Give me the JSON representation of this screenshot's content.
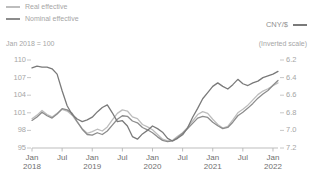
{
  "legend": {
    "items": [
      {
        "label": "Real effective",
        "color": "#bdbdbd",
        "name": "legend-real-effective"
      },
      {
        "label": "Nominal effective",
        "color": "#8c8c8c",
        "name": "legend-nominal-effective"
      }
    ],
    "right": {
      "label": "CNY/$",
      "color": "#7a7a7a"
    }
  },
  "notes": {
    "left": "Jan 2018 = 100",
    "right": "(Inverted scale)"
  },
  "chart_data": {
    "type": "line",
    "title": "",
    "subtitle": "",
    "xlabel": "",
    "ylabel": "Jan 2018 = 100",
    "y2label": "CNY/$",
    "grid": false,
    "legend_position": "top-left",
    "ylim": [
      95,
      110
    ],
    "yticks": [
      "110",
      "107",
      "104",
      "101",
      "98",
      "95"
    ],
    "y2lim": [
      7.2,
      6.2
    ],
    "y2ticks": [
      "6.2",
      "6.4",
      "6.6",
      "6.8",
      "7.0",
      "7.2"
    ],
    "y2_inverted": true,
    "xticks": [
      {
        "label": "Jan",
        "sub": "2018"
      },
      {
        "label": "Jul",
        "sub": ""
      },
      {
        "label": "Jan",
        "sub": "2019"
      },
      {
        "label": "Jul",
        "sub": ""
      },
      {
        "label": "Jan",
        "sub": "2020"
      },
      {
        "label": "Jul",
        "sub": ""
      },
      {
        "label": "Jan",
        "sub": "2021"
      },
      {
        "label": "Jul",
        "sub": ""
      },
      {
        "label": "Jan",
        "sub": "2022"
      }
    ],
    "x": [
      "2018-01",
      "2018-02",
      "2018-03",
      "2018-04",
      "2018-05",
      "2018-06",
      "2018-07",
      "2018-08",
      "2018-09",
      "2018-10",
      "2018-11",
      "2018-12",
      "2019-01",
      "2019-02",
      "2019-03",
      "2019-04",
      "2019-05",
      "2019-06",
      "2019-07",
      "2019-08",
      "2019-09",
      "2019-10",
      "2019-11",
      "2019-12",
      "2020-01",
      "2020-02",
      "2020-03",
      "2020-04",
      "2020-05",
      "2020-06",
      "2020-07",
      "2020-08",
      "2020-09",
      "2020-10",
      "2020-11",
      "2020-12",
      "2021-01",
      "2021-02",
      "2021-03",
      "2021-04",
      "2021-05",
      "2021-06",
      "2021-07",
      "2021-08",
      "2021-09",
      "2021-10",
      "2021-11",
      "2021-12",
      "2022-01",
      "2022-02"
    ],
    "series": [
      {
        "name": "Real effective",
        "axis": "left",
        "color": "#bdbdbd",
        "values": [
          100.0,
          100.6,
          101.4,
          100.7,
          100.3,
          100.9,
          101.6,
          101.3,
          100.6,
          99.4,
          98.3,
          97.5,
          97.8,
          98.2,
          97.9,
          98.6,
          99.8,
          100.9,
          101.5,
          101.3,
          100.3,
          100.0,
          99.0,
          98.6,
          98.1,
          97.3,
          96.5,
          96.2,
          96.3,
          97.0,
          97.6,
          98.5,
          99.6,
          100.7,
          101.2,
          100.9,
          99.9,
          99.0,
          98.4,
          98.7,
          99.8,
          101.0,
          101.6,
          102.3,
          103.2,
          104.1,
          104.7,
          105.1,
          105.6,
          106.1
        ]
      },
      {
        "name": "Nominal effective",
        "axis": "left",
        "color": "#8c8c8c",
        "values": [
          99.7,
          100.3,
          101.1,
          100.5,
          100.1,
          100.8,
          101.7,
          101.5,
          100.9,
          99.5,
          98.2,
          97.3,
          97.2,
          97.6,
          97.3,
          97.9,
          98.9,
          99.9,
          100.5,
          100.4,
          99.6,
          99.3,
          98.5,
          98.1,
          97.6,
          96.9,
          96.3,
          96.1,
          96.2,
          96.8,
          97.5,
          98.3,
          99.2,
          100.1,
          100.4,
          100.2,
          99.4,
          98.8,
          98.3,
          98.5,
          99.4,
          100.5,
          101.1,
          101.8,
          102.6,
          103.5,
          104.2,
          104.8,
          105.7,
          106.5
        ]
      },
      {
        "name": "CNY/$",
        "axis": "right",
        "color": "#7a7a7a",
        "values": [
          6.29,
          6.27,
          6.28,
          6.28,
          6.3,
          6.36,
          6.55,
          6.72,
          6.82,
          6.87,
          6.9,
          6.88,
          6.85,
          6.79,
          6.74,
          6.71,
          6.8,
          6.9,
          6.89,
          6.95,
          7.07,
          7.1,
          7.04,
          7.0,
          6.95,
          6.98,
          7.02,
          7.09,
          7.12,
          7.09,
          7.05,
          6.97,
          6.85,
          6.75,
          6.64,
          6.57,
          6.5,
          6.46,
          6.5,
          6.53,
          6.48,
          6.42,
          6.47,
          6.49,
          6.46,
          6.44,
          6.4,
          6.38,
          6.36,
          6.33
        ]
      }
    ]
  }
}
